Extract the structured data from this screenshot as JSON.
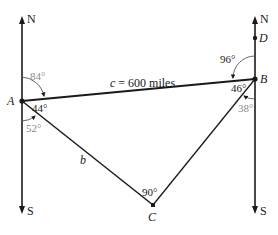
{
  "diagram": {
    "points": {
      "A": {
        "label": "A",
        "x": 22,
        "y": 101
      },
      "B": {
        "label": "B",
        "x": 255,
        "y": 79
      },
      "C": {
        "label": "C",
        "x": 153,
        "y": 205
      },
      "D": {
        "label": "D",
        "x": 255,
        "y": 38
      }
    },
    "compass": {
      "left": {
        "north": "N",
        "south": "S"
      },
      "right": {
        "north": "N",
        "south": "S"
      }
    },
    "sides": {
      "c": "c = 600 miles",
      "b": "b"
    },
    "angles": {
      "A_bearing_to_B": "84°",
      "A_interior": "44°",
      "A_south_to_C": "52°",
      "B_north_to_A": "96°",
      "B_interior": "46°",
      "B_south_to_C": "38°",
      "C_interior": "90°"
    },
    "colors": {
      "line": "#1a1a1a",
      "gray_annotation": "#8a8a8a"
    }
  }
}
